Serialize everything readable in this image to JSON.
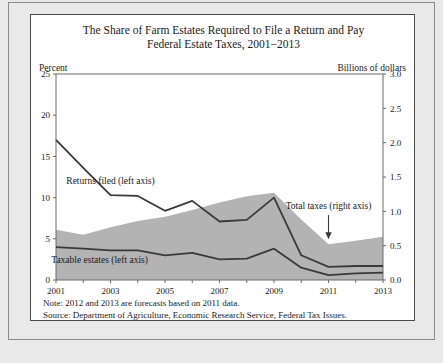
{
  "figure": {
    "title_line1": "The Share of Farm Estates Required to File a Return and Pay",
    "title_line2": "Federal Estate Taxes, 2001−2013",
    "left_axis_caption": "Percent",
    "right_axis_caption": "Billions of dollars",
    "note": "Note: 2012 and 2013 are forecasts based on 2011 data.",
    "source": "Source: Department of Agriculture, Economic Research Service, Federal Tax Issues.",
    "colors": {
      "area_fill": "#b3b3b3",
      "line": "#3a3a3a",
      "axis": "#6b6b6b",
      "card_background": "#ffffff",
      "page_background": "#e9e9e9"
    }
  },
  "chart_data": {
    "type": "line",
    "title": "The Share of Farm Estates Required to File a Return and Pay Federal Estate Taxes, 2001−2013",
    "xlabel": "",
    "ylabel": "Percent",
    "y2label": "Billions of dollars",
    "x": [
      2001,
      2002,
      2003,
      2004,
      2005,
      2006,
      2007,
      2008,
      2009,
      2010,
      2011,
      2012,
      2013
    ],
    "xlim": [
      2001,
      2013
    ],
    "xticks": [
      2001,
      2002,
      2003,
      2004,
      2005,
      2006,
      2007,
      2008,
      2009,
      2010,
      2011,
      2012,
      2013
    ],
    "xticklabels": [
      "2001",
      "",
      "2003",
      "",
      "2005",
      "",
      "2007",
      "",
      "2009",
      "",
      "2011",
      "",
      "2013"
    ],
    "ylim": [
      0,
      25
    ],
    "yticks": [
      0,
      5,
      10,
      15,
      20,
      25
    ],
    "yticklabels": [
      "0",
      "5",
      "10",
      "15",
      "20",
      "25"
    ],
    "y2lim": [
      0,
      3.0
    ],
    "y2ticks": [
      0.0,
      0.5,
      1.0,
      1.5,
      2.0,
      2.5,
      3.0
    ],
    "y2ticklabels": [
      "0.0",
      "0.5",
      "1.0",
      "1.5",
      "2.0",
      "2.5",
      "3.0"
    ],
    "grid": false,
    "legend": "inline-annotations",
    "series": [
      {
        "name": "Returns filed (left axis)",
        "axis": "left",
        "style": "line",
        "units": "percent",
        "values": [
          17.0,
          13.6,
          10.3,
          10.2,
          8.4,
          9.6,
          7.1,
          7.3,
          10.0,
          3.0,
          1.6,
          1.7,
          1.7
        ]
      },
      {
        "name": "Taxable estates (left axis)",
        "axis": "left",
        "style": "line",
        "units": "percent",
        "values": [
          4.0,
          3.8,
          3.6,
          3.6,
          3.0,
          3.3,
          2.5,
          2.6,
          3.8,
          1.5,
          0.6,
          0.8,
          0.9
        ]
      },
      {
        "name": "Total taxes (right axis)",
        "axis": "right",
        "style": "area",
        "units": "billions of dollars",
        "values": [
          0.73,
          0.66,
          0.77,
          0.86,
          0.92,
          1.02,
          1.13,
          1.22,
          1.27,
          0.88,
          0.52,
          0.57,
          0.63
        ]
      }
    ],
    "annotations": [
      {
        "text": "Returns filed (left axis)",
        "x": 2003.0,
        "y": 11.7,
        "series": "Returns filed (left axis)"
      },
      {
        "text": "Taxable estates (left axis)",
        "x": 2002.6,
        "y": 2.1,
        "series": "Taxable estates (left axis)"
      },
      {
        "text": "Total taxes (right axis)",
        "x": 2011.0,
        "y": 8.6,
        "series": "Total taxes (right axis)",
        "arrow": true
      }
    ]
  }
}
